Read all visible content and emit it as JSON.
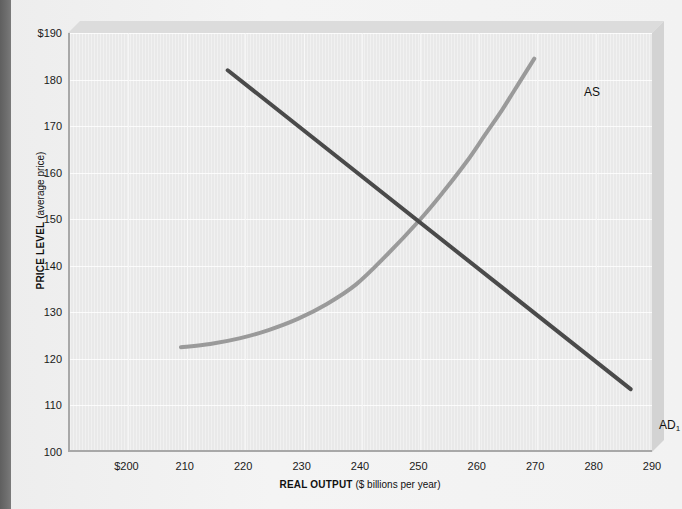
{
  "chart_data": {
    "type": "line",
    "title": "",
    "xlabel_bold": "REAL OUTPUT",
    "xlabel_regular": "($ billions per year)",
    "ylabel_bold": "PRICE LEVEL",
    "ylabel_regular": "(average price)",
    "xlim": [
      190,
      290
    ],
    "ylim": [
      100,
      190
    ],
    "xticks": [
      200,
      210,
      220,
      230,
      240,
      250,
      260,
      270,
      280,
      290
    ],
    "xtick_labels": [
      "$200",
      "210",
      "220",
      "230",
      "240",
      "250",
      "260",
      "270",
      "280",
      "290"
    ],
    "yticks": [
      100,
      110,
      120,
      130,
      140,
      150,
      160,
      170,
      180,
      190
    ],
    "ytick_labels": [
      "100",
      "110",
      "120",
      "130",
      "140",
      "150",
      "160",
      "170",
      "180",
      "$190"
    ],
    "grid": true,
    "legend_position": "inline-curve-labels",
    "equilibrium": {
      "output": 250,
      "price_level": 150
    },
    "series": [
      {
        "name": "AS",
        "label": "AS",
        "label_subscript": "",
        "description": "aggregate supply, upward sloping, convex",
        "color": "#9a9a9a",
        "width": 4,
        "points": [
          [
            209.0,
            122.5
          ],
          [
            214.0,
            123.2
          ],
          [
            219.0,
            124.4
          ],
          [
            224.0,
            126.2
          ],
          [
            229.0,
            128.6
          ],
          [
            234.0,
            131.8
          ],
          [
            239.0,
            136.0
          ],
          [
            244.0,
            142.0
          ],
          [
            250.0,
            150.0
          ],
          [
            254.0,
            156.0
          ],
          [
            258.0,
            162.5
          ],
          [
            261.0,
            168.0
          ],
          [
            264.0,
            173.5
          ],
          [
            266.0,
            177.5
          ],
          [
            268.0,
            181.5
          ],
          [
            269.5,
            184.5
          ]
        ]
      },
      {
        "name": "AD1",
        "label": "AD",
        "label_subscript": "1",
        "description": "aggregate demand, straight downward sloping line",
        "color": "#4a4a4a",
        "width": 4,
        "points": [
          [
            217.0,
            182.0
          ],
          [
            286.0,
            113.5
          ]
        ]
      }
    ],
    "annotations": [
      {
        "name": "as-curve-label",
        "text": "AS",
        "x": 270.5,
        "y": 183.0
      },
      {
        "name": "ad-curve-label",
        "text": "AD",
        "subscript": "1",
        "x": 284.0,
        "y": 111.0
      }
    ]
  },
  "colors": {
    "page_background": "#f2f2f2",
    "plot_background": "#e9e9e9",
    "gridline": "#fbfbfb",
    "axis": "#a8a8a8",
    "as_curve": "#9a9a9a",
    "ad_curve": "#4a4a4a",
    "gutter": "#6b6b6b",
    "text": "#111111"
  }
}
